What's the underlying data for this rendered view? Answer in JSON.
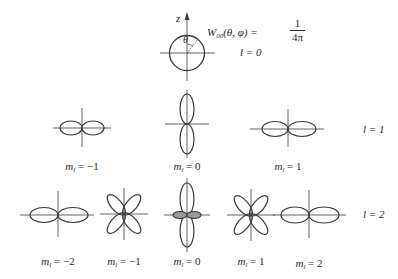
{
  "figure": {
    "stroke_color": "#3a3a3a",
    "background": "#ffffff"
  },
  "top": {
    "axis_label": "z",
    "angle_label": "θ",
    "formula": {
      "lhs_main": "W",
      "lhs_sub": "00",
      "lhs_args": "(θ, φ) =",
      "numerator": "1",
      "denominator": "4π"
    },
    "l_label": "l = 0"
  },
  "rows": [
    {
      "l_label": "l = 1",
      "items": [
        {
          "m_prefix": "m",
          "m_sub": "l",
          "m_value": " = −1",
          "shape": "horizontal-dumbbell"
        },
        {
          "m_prefix": "m",
          "m_sub": "l",
          "m_value": " = 0",
          "shape": "vertical-dumbbell"
        },
        {
          "m_prefix": "m",
          "m_sub": "l",
          "m_value": " = 1",
          "shape": "horizontal-dumbbell"
        }
      ]
    },
    {
      "l_label": "l = 2",
      "items": [
        {
          "m_prefix": "m",
          "m_sub": "l",
          "m_value": " = −2",
          "shape": "horizontal-dumbbell"
        },
        {
          "m_prefix": "m",
          "m_sub": "l",
          "m_value": " = −1",
          "shape": "four-petal-diagonal"
        },
        {
          "m_prefix": "m",
          "m_sub": "l",
          "m_value": " = 0",
          "shape": "vertical-dumbbell-with-ring"
        },
        {
          "m_prefix": "m",
          "m_sub": "l",
          "m_value": " = 1",
          "shape": "four-petal-diagonal"
        },
        {
          "m_prefix": "m",
          "m_sub": "l",
          "m_value": " = 2",
          "shape": "horizontal-dumbbell"
        }
      ]
    }
  ]
}
